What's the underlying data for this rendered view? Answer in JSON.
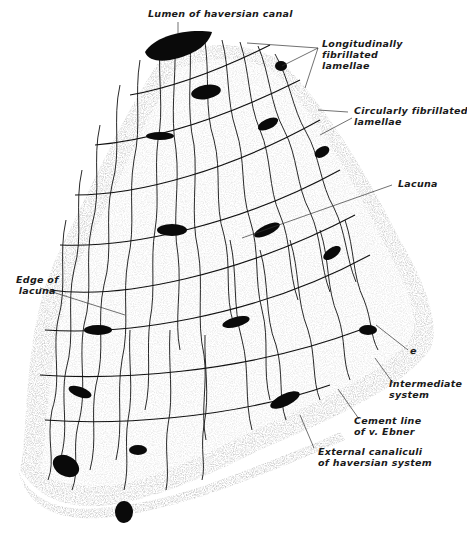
{
  "figure": {
    "labels": {
      "lumen": "Lumen of haversian canal",
      "longitudinal": [
        "Longitudinally",
        "fibrillated",
        "lamellae"
      ],
      "circular": [
        "Circularly fibrillated",
        "lamellae"
      ],
      "lacuna": "Lacuna",
      "edge_of_lacuna": [
        "Edge of",
        "lacuna"
      ],
      "e": "e",
      "intermediate": [
        "Intermediate",
        "system"
      ],
      "cement": [
        "Cement line",
        "of v. Ebner"
      ],
      "external": [
        "External canaliculi",
        "of haversian system"
      ]
    },
    "colors": {
      "ink": "#111111",
      "stipple": "#c8c8c8",
      "background": "#ffffff"
    }
  }
}
